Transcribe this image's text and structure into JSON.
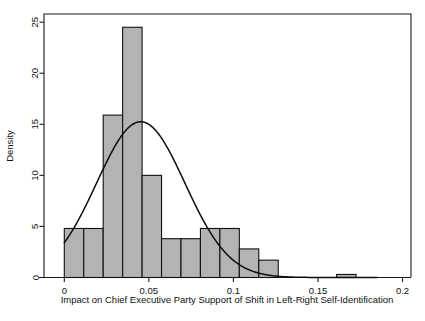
{
  "chart_data": {
    "type": "bar",
    "title": "",
    "subtitle": "",
    "xlabel": "Impact on Chief Executive Party Support of Shift in Left-Right Self-Identification",
    "ylabel": "Density",
    "xlim": [
      -0.012,
      0.205
    ],
    "ylim": [
      0,
      25.8
    ],
    "grid": false,
    "legend": null,
    "bin_width": 0.0115,
    "categories": [
      "0.000-0.0115",
      "0.0115-0.023",
      "0.023-0.0345",
      "0.0345-0.046",
      "0.046-0.0575",
      "0.0575-0.069",
      "0.069-0.0805",
      "0.0805-0.092",
      "0.092-0.1035",
      "0.1035-0.115",
      "0.115-0.1265",
      "0.1265-0.138",
      "0.138-0.1495",
      "0.1495-0.161",
      "0.161-0.1725"
    ],
    "bin_starts": [
      0.0,
      0.0115,
      0.023,
      0.0345,
      0.046,
      0.0575,
      0.069,
      0.0805,
      0.092,
      0.1035,
      0.115,
      0.1265,
      0.138,
      0.1495,
      0.161
    ],
    "values": [
      4.8,
      4.8,
      15.9,
      24.5,
      10.0,
      3.8,
      3.8,
      4.8,
      4.8,
      2.8,
      1.7,
      0,
      0,
      0,
      0.3
    ],
    "bars": [
      {
        "x0": 0.0,
        "x1": 0.0115,
        "height": 4.8
      },
      {
        "x0": 0.0115,
        "x1": 0.023,
        "height": 4.8
      },
      {
        "x0": 0.023,
        "x1": 0.0345,
        "height": 15.9
      },
      {
        "x0": 0.0345,
        "x1": 0.046,
        "height": 24.5
      },
      {
        "x0": 0.046,
        "x1": 0.0575,
        "height": 10.0
      },
      {
        "x0": 0.0575,
        "x1": 0.069,
        "height": 3.8
      },
      {
        "x0": 0.069,
        "x1": 0.0805,
        "height": 3.8
      },
      {
        "x0": 0.0805,
        "x1": 0.092,
        "height": 4.8
      },
      {
        "x0": 0.092,
        "x1": 0.1035,
        "height": 4.8
      },
      {
        "x0": 0.1035,
        "x1": 0.115,
        "height": 2.8
      },
      {
        "x0": 0.115,
        "x1": 0.1265,
        "height": 1.7
      },
      {
        "x0": 0.161,
        "x1": 0.1725,
        "height": 0.3
      }
    ],
    "x_ticks": [
      0,
      0.05,
      0.1,
      0.15,
      0.2
    ],
    "x_tick_labels": [
      "0",
      "0.05",
      "0.1",
      "0.15",
      "0.2"
    ],
    "y_ticks": [
      0,
      5,
      10,
      15,
      20,
      25
    ],
    "y_tick_labels": [
      "0",
      "5",
      "10",
      "15",
      "20",
      "25"
    ],
    "overlay_curve": {
      "name": "normal-density-fit",
      "mean": 0.0452,
      "sd": 0.0261,
      "peak_value": 15.25,
      "x_start": 0.0,
      "x_end": 0.135
    },
    "colors": {
      "bar_fill": "#b3b3b3",
      "bar_edge": "#111111",
      "curve": "#0d0d0d",
      "axis": "#1a1a1a",
      "background": "#ffffff"
    }
  }
}
